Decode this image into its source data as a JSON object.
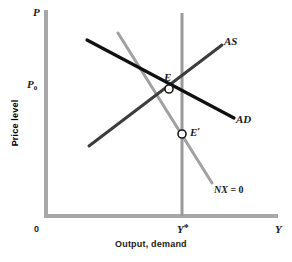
{
  "figure": {
    "background": "#ffffff",
    "axis_color": "#a8a8a8",
    "width": 292,
    "height": 262
  },
  "axes": {
    "y_axis_symbol": "P",
    "y_axis_title": "Price level",
    "x_axis_symbol": "Y",
    "x_axis_title": "Output, demand",
    "origin_label": "0",
    "y_tick_label": "P",
    "y_tick_sub": "0",
    "x_tick_label": "Y",
    "x_tick_star": "*"
  },
  "curves": [
    {
      "name": "AD",
      "label": "AD",
      "color": "#111111",
      "width": 3.2,
      "x1": 87,
      "y1": 40,
      "x2": 234,
      "y2": 118,
      "label_x": 236,
      "label_y": 118
    },
    {
      "name": "AS",
      "label": "AS",
      "color": "#3c3c3c",
      "width": 3.0,
      "x1": 89,
      "y1": 146,
      "x2": 222,
      "y2": 45,
      "label_x": 224,
      "label_y": 41
    },
    {
      "name": "NX0",
      "label": "NX",
      "label_eq": " = 0",
      "color": "#a0a0a0",
      "width": 3.0,
      "x1": 118,
      "y1": 33,
      "x2": 212,
      "y2": 183,
      "label_x": 214,
      "label_y": 190
    },
    {
      "name": "Ystar-vertical",
      "label": "",
      "color": "#9a9a9a",
      "width": 3.0,
      "x1": 182,
      "y1": 13,
      "x2": 182,
      "y2": 216
    }
  ],
  "points": [
    {
      "name": "E",
      "label": "E",
      "cx": 169,
      "cy": 89,
      "r": 4,
      "label_x": 164,
      "label_y": 74
    },
    {
      "name": "E-prime",
      "label": "E",
      "prime": "′",
      "cx": 182,
      "cy": 134,
      "r": 4,
      "label_x": 190,
      "label_y": 128
    }
  ],
  "marker": {
    "fill": "#ffffff",
    "stroke": "#1a1a1a",
    "stroke_width": 1.6
  },
  "geometry": {
    "y_axis_x": 46,
    "x_axis_y": 216,
    "y_axis_top": 10,
    "x_axis_right": 278,
    "axis_thickness": 4,
    "p0_y": 85,
    "ystar_x": 182
  }
}
